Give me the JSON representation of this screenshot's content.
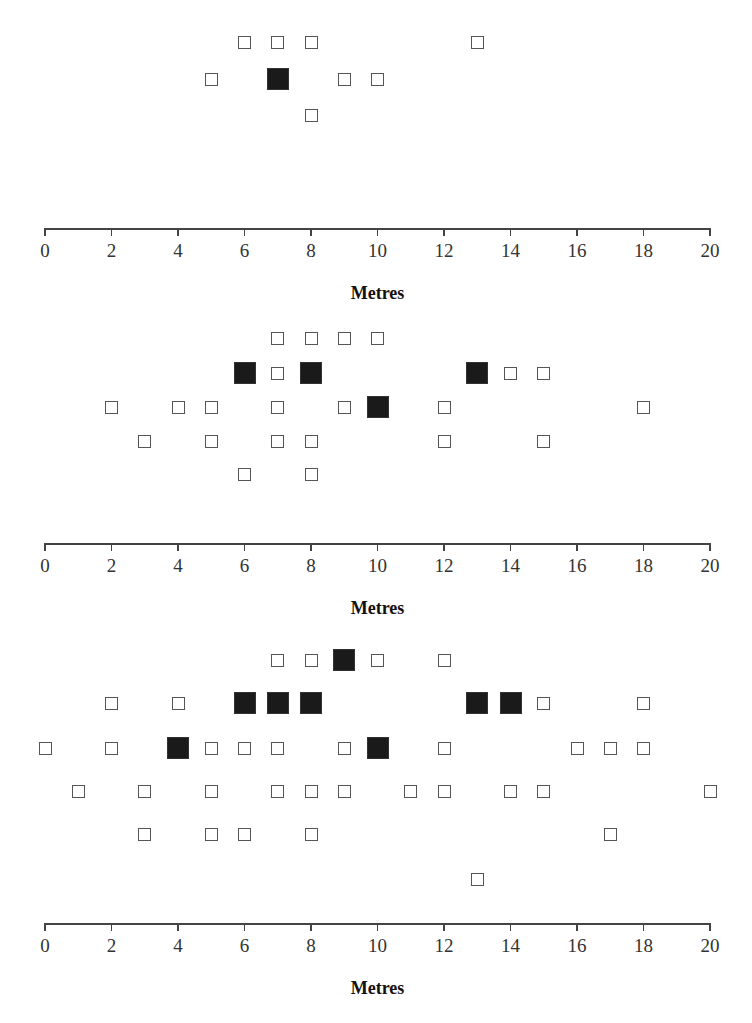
{
  "chart_data": [
    {
      "type": "scatter",
      "title": "",
      "xlabel": "Metres",
      "ylabel": "",
      "xlim": [
        0,
        20
      ],
      "x_ticks": [
        0,
        2,
        4,
        6,
        8,
        10,
        12,
        14,
        16,
        18,
        20
      ],
      "grid": false,
      "legend": null,
      "marker_types": {
        "open": "open square",
        "filled": "filled black square (larger)"
      },
      "axis_y": 228,
      "rows": [
        {
          "y": 42,
          "open": [
            6,
            7,
            8,
            13
          ],
          "filled": []
        },
        {
          "y": 79,
          "open": [
            5,
            9,
            10
          ],
          "filled": [
            7
          ]
        },
        {
          "y": 115,
          "open": [
            8
          ],
          "filled": []
        }
      ]
    },
    {
      "type": "scatter",
      "title": "",
      "xlabel": "Metres",
      "ylabel": "",
      "xlim": [
        0,
        20
      ],
      "x_ticks": [
        0,
        2,
        4,
        6,
        8,
        10,
        12,
        14,
        16,
        18,
        20
      ],
      "grid": false,
      "legend": null,
      "marker_types": {
        "open": "open square",
        "filled": "filled black square (larger)"
      },
      "axis_y": 543,
      "rows": [
        {
          "y": 338,
          "open": [
            7,
            8,
            9,
            10
          ],
          "filled": []
        },
        {
          "y": 373,
          "open": [
            7,
            14,
            15
          ],
          "filled": [
            6,
            8,
            13
          ]
        },
        {
          "y": 407,
          "open": [
            2,
            4,
            5,
            7,
            9,
            12,
            18
          ],
          "filled": [
            10
          ]
        },
        {
          "y": 441,
          "open": [
            3,
            5,
            7,
            8,
            12,
            15
          ],
          "filled": []
        },
        {
          "y": 474,
          "open": [
            6,
            8
          ],
          "filled": []
        }
      ]
    },
    {
      "type": "scatter",
      "title": "",
      "xlabel": "Metres",
      "ylabel": "",
      "xlim": [
        0,
        20
      ],
      "x_ticks": [
        0,
        2,
        4,
        6,
        8,
        10,
        12,
        14,
        16,
        18,
        20
      ],
      "grid": false,
      "legend": null,
      "marker_types": {
        "open": "open square",
        "filled": "filled black square (larger)"
      },
      "axis_y": 923,
      "rows": [
        {
          "y": 660,
          "open": [
            7,
            8,
            10,
            12
          ],
          "filled": [
            9
          ]
        },
        {
          "y": 703,
          "open": [
            2,
            4,
            15,
            18
          ],
          "filled": [
            6,
            7,
            8,
            13,
            14
          ]
        },
        {
          "y": 748,
          "open": [
            0,
            2,
            5,
            6,
            7,
            9,
            12,
            16,
            17,
            18
          ],
          "filled": [
            4,
            10
          ]
        },
        {
          "y": 791,
          "open": [
            1,
            3,
            5,
            7,
            8,
            9,
            11,
            12,
            14,
            15,
            20
          ],
          "filled": []
        },
        {
          "y": 834,
          "open": [
            3,
            5,
            6,
            8,
            17
          ],
          "filled": []
        },
        {
          "y": 879,
          "open": [
            13
          ],
          "filled": []
        }
      ]
    }
  ],
  "panels": [
    {
      "xlabel": "Metres"
    },
    {
      "xlabel": "Metres"
    },
    {
      "xlabel": "Metres"
    }
  ],
  "colors": {
    "filled": "#1a1a1a",
    "open_border": "#555555",
    "axis": "#444444"
  }
}
